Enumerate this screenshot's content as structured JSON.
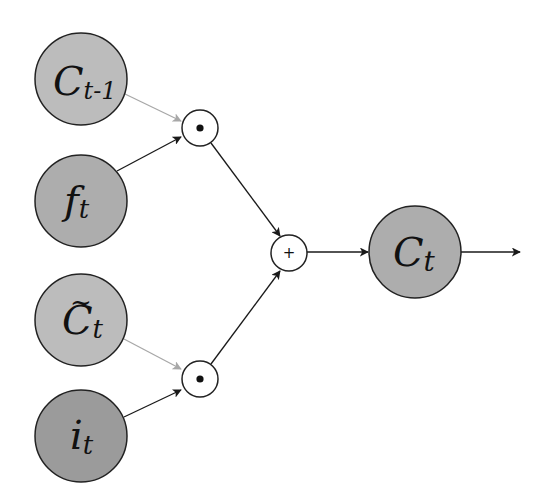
{
  "diagram": {
    "colors": {
      "background": "#ffffff",
      "stroke": "#222222",
      "edge_dark": "#1a1a1a",
      "edge_light": "#a8a8a8",
      "node_light": "#bcbcbc",
      "node_mid": "#adadad",
      "node_dark": "#9b9b9b",
      "op_fill": "#ffffff"
    },
    "nodes": [
      {
        "id": "c_prev",
        "main": "C",
        "sub": "t-1",
        "tilde": false,
        "cx": 81,
        "cy": 79,
        "r": 46,
        "fill": "#bcbcbc"
      },
      {
        "id": "f_t",
        "main": "f",
        "sub": "t",
        "tilde": false,
        "cx": 81,
        "cy": 201,
        "r": 46,
        "fill": "#adadad"
      },
      {
        "id": "c_tilde",
        "main": "C",
        "sub": "t",
        "tilde": true,
        "cx": 81,
        "cy": 320,
        "r": 46,
        "fill": "#bcbcbc"
      },
      {
        "id": "i_t",
        "main": "i",
        "sub": "t",
        "tilde": false,
        "cx": 81,
        "cy": 436,
        "r": 46,
        "fill": "#9b9b9b"
      },
      {
        "id": "c_t",
        "main": "C",
        "sub": "t",
        "tilde": false,
        "cx": 415,
        "cy": 252,
        "r": 46,
        "fill": "#adadad"
      }
    ],
    "operators": [
      {
        "id": "mult_top",
        "symbol": "⊙",
        "type": "hadamard",
        "cx": 200,
        "cy": 128,
        "r": 18
      },
      {
        "id": "mult_bottom",
        "symbol": "⊙",
        "type": "hadamard",
        "cx": 200,
        "cy": 379,
        "r": 18
      },
      {
        "id": "add",
        "symbol": "+",
        "type": "add",
        "cx": 289,
        "cy": 253,
        "r": 18
      }
    ],
    "edges": [
      {
        "from": "c_prev",
        "to": "mult_top",
        "style": "light"
      },
      {
        "from": "f_t",
        "to": "mult_top",
        "style": "dark"
      },
      {
        "from": "c_tilde",
        "to": "mult_bottom",
        "style": "light"
      },
      {
        "from": "i_t",
        "to": "mult_bottom",
        "style": "dark"
      },
      {
        "from": "mult_top",
        "to": "add",
        "style": "dark"
      },
      {
        "from": "mult_bottom",
        "to": "add",
        "style": "dark"
      },
      {
        "from": "add",
        "to": "c_t",
        "style": "dark"
      },
      {
        "from": "c_t",
        "to": "output",
        "style": "dark"
      }
    ],
    "labels": {
      "c_prev_main": "C",
      "c_prev_sub": "t-1",
      "f_main": "f",
      "f_sub": "t",
      "c_tilde_main": "C",
      "c_tilde_sub": "t",
      "c_tilde_accent": "~",
      "i_main": "i",
      "i_sub": "t",
      "c_t_main": "C",
      "c_t_sub": "t",
      "add_symbol": "+"
    }
  }
}
